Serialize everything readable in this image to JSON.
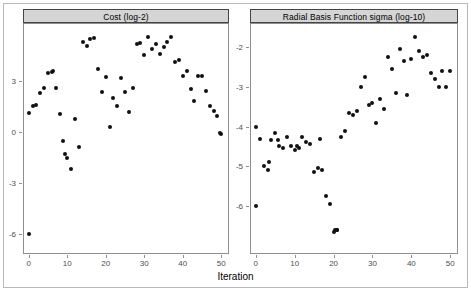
{
  "figure": {
    "background": "#ffffff",
    "frame_color": "#b9b9b9",
    "strip_background": "#d5d5d5",
    "point_color": "#111111",
    "axis_color": "#8f8f8f",
    "xaxis_title": "Iteration"
  },
  "chart_data": [
    {
      "type": "scatter",
      "title": "Cost (log-2)",
      "xlabel": "Iteration",
      "ylabel": "",
      "xlim": [
        -1.5,
        52
      ],
      "ylim": [
        -7.2,
        6.4
      ],
      "xticks": [
        0,
        10,
        20,
        30,
        40,
        50
      ],
      "yticks": [
        -6,
        -3,
        0,
        3
      ],
      "xtick_labels": [
        "0",
        "10",
        "20",
        "30",
        "40",
        "50"
      ],
      "ytick_labels": [
        "-6",
        "-3",
        "0",
        "3"
      ],
      "grid": false,
      "legend": "none",
      "x": [
        0,
        0,
        1,
        2,
        3,
        4,
        5,
        6,
        6.4,
        7,
        8,
        9,
        9.4,
        10,
        11,
        12,
        13,
        14,
        15,
        16,
        17,
        18,
        19,
        20,
        21,
        22,
        23,
        24,
        25,
        26,
        27,
        28,
        29,
        30,
        31,
        32,
        33,
        34,
        35,
        36,
        37,
        38,
        39,
        40,
        41,
        42,
        43,
        44,
        45,
        46,
        47,
        48,
        49,
        49.6,
        50
      ],
      "y": [
        -6.0,
        1.1,
        1.5,
        1.6,
        2.3,
        2.55,
        3.45,
        3.5,
        3.6,
        2.6,
        1.05,
        -0.55,
        -1.3,
        -1.55,
        -2.2,
        0.75,
        -0.9,
        5.3,
        5.05,
        5.45,
        5.5,
        3.7,
        2.35,
        3.25,
        0.25,
        2.0,
        1.5,
        3.15,
        2.35,
        1.15,
        2.6,
        5.15,
        5.2,
        4.5,
        5.6,
        4.85,
        5.15,
        4.6,
        5.0,
        5.3,
        5.55,
        4.1,
        4.25,
        3.3,
        3.6,
        2.5,
        1.8,
        3.3,
        3.3,
        2.4,
        1.5,
        1.2,
        0.9,
        -0.1,
        -0.15
      ]
    },
    {
      "type": "scatter",
      "title": "Radial Basis Function sigma (log-10)",
      "xlabel": "Iteration",
      "ylabel": "",
      "xlim": [
        -1.5,
        52
      ],
      "ylim": [
        -7.2,
        -1.4
      ],
      "xticks": [
        0,
        10,
        20,
        30,
        40,
        50
      ],
      "yticks": [
        -6,
        -5,
        -4,
        -3,
        -2
      ],
      "xtick_labels": [
        "0",
        "10",
        "20",
        "30",
        "40",
        "50"
      ],
      "ytick_labels": [
        "-6",
        "-5",
        "-4",
        "-3",
        "-2"
      ],
      "grid": false,
      "legend": "none",
      "x": [
        0,
        0,
        1,
        2,
        3,
        3.4,
        4,
        5,
        5.6,
        6,
        7,
        8,
        9,
        10,
        10.6,
        11,
        12,
        13,
        14,
        15,
        16,
        16.6,
        17,
        18,
        19,
        20,
        20.4,
        20.8,
        21,
        22,
        23,
        24,
        25,
        26,
        27,
        28,
        29,
        30,
        31,
        32,
        33,
        34,
        35,
        36,
        37,
        38,
        39,
        40,
        41,
        42,
        43,
        44,
        45,
        46,
        47,
        48,
        49,
        50
      ],
      "y": [
        -6.0,
        -4.0,
        -4.3,
        -5.0,
        -5.1,
        -4.9,
        -4.35,
        -4.15,
        -4.35,
        -4.5,
        -4.55,
        -4.25,
        -4.5,
        -4.6,
        -4.5,
        -4.55,
        -4.25,
        -4.4,
        -4.45,
        -5.15,
        -5.05,
        -4.3,
        -5.1,
        -5.75,
        -5.95,
        -6.65,
        -6.6,
        -6.6,
        -6.6,
        -4.25,
        -4.1,
        -3.65,
        -3.7,
        -3.6,
        -3.0,
        -2.75,
        -3.45,
        -3.4,
        -3.9,
        -3.3,
        -3.55,
        -2.25,
        -2.55,
        -3.15,
        -2.05,
        -2.35,
        -3.2,
        -2.3,
        -1.75,
        -2.1,
        -2.25,
        -2.2,
        -2.65,
        -2.8,
        -3.0,
        -2.6,
        -3.0,
        -2.6
      ]
    }
  ]
}
